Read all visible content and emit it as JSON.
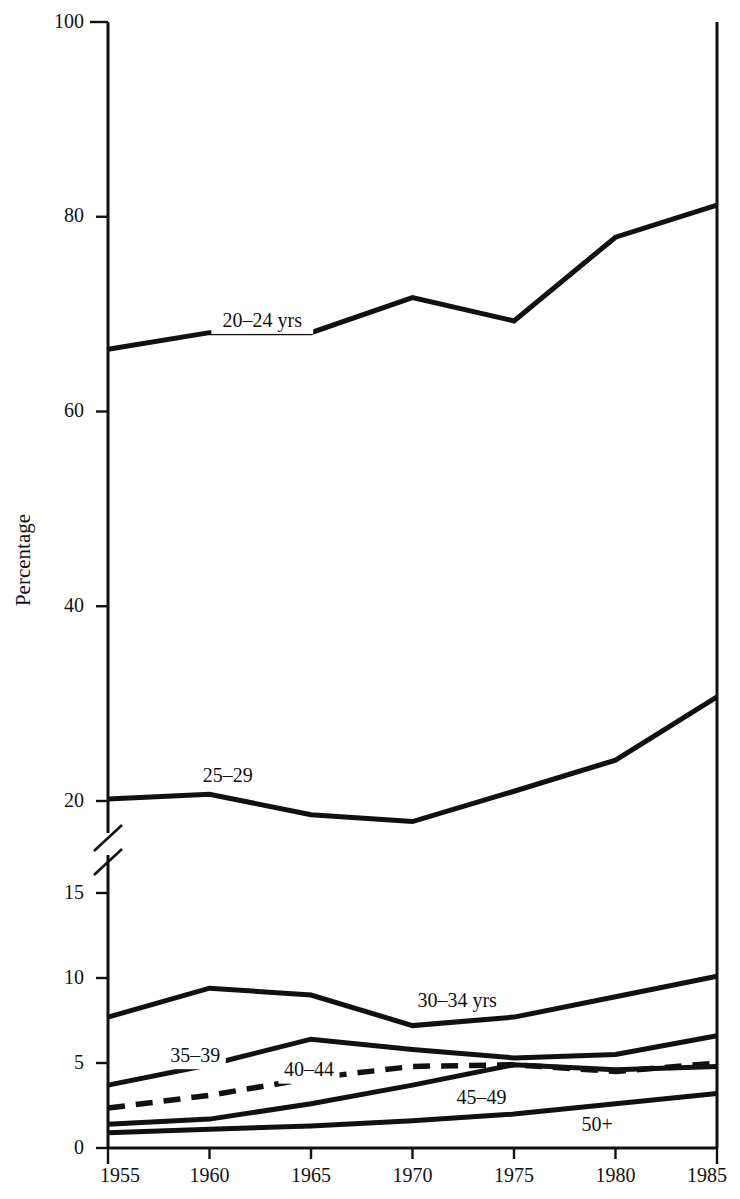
{
  "chart_data": {
    "type": "line",
    "title": "",
    "subtitle": "",
    "xlabel": "",
    "ylabel": "Percentage",
    "x": [
      1955,
      1960,
      1965,
      1970,
      1975,
      1980,
      1985
    ],
    "xtick_labels": [
      "1955",
      "1960",
      "1965",
      "1970",
      "1975",
      "1980",
      "1985"
    ],
    "ytick_labels_upper": [
      "100",
      "80",
      "60",
      "40",
      "20"
    ],
    "ytick_values_upper": [
      100,
      80,
      60,
      40,
      20
    ],
    "ytick_labels_lower": [
      "15",
      "10",
      "5",
      "0"
    ],
    "ytick_values_lower": [
      15,
      10,
      5,
      0
    ],
    "ylim_upper": [
      20,
      100
    ],
    "ylim_lower": [
      0,
      15
    ],
    "axis_break": true,
    "axis_break_between": [
      15,
      20
    ],
    "grid": false,
    "legend_position": "inline-on-lines",
    "series": [
      {
        "name": "20-24 yrs",
        "label": "20–24 yrs",
        "style": "solid",
        "values": [
          66.4,
          68.1,
          68.1,
          71.7,
          69.3,
          77.9,
          81.2
        ]
      },
      {
        "name": "25-29",
        "label": "25–29",
        "style": "solid",
        "values": [
          20.2,
          20.7,
          19.6,
          19.2,
          21.0,
          24.2,
          30.7
        ]
      },
      {
        "name": "30-34 yrs",
        "label": "30–34 yrs",
        "style": "solid",
        "values": [
          7.7,
          9.4,
          9.0,
          7.2,
          7.7,
          8.9,
          10.1
        ]
      },
      {
        "name": "35-39",
        "label": "35–39",
        "style": "solid",
        "values": [
          3.7,
          4.9,
          6.4,
          5.8,
          5.3,
          5.5,
          6.6
        ]
      },
      {
        "name": "40-44",
        "label": "40–44",
        "style": "dashed",
        "values": [
          2.35,
          3.1,
          4.1,
          4.8,
          4.9,
          4.5,
          5.0
        ]
      },
      {
        "name": "45-49",
        "label": "45–49",
        "style": "solid",
        "values": [
          1.4,
          1.7,
          2.6,
          3.7,
          4.9,
          4.6,
          4.8
        ]
      },
      {
        "name": "50+",
        "label": "50+",
        "style": "solid",
        "values": [
          0.9,
          1.1,
          1.3,
          1.6,
          2.0,
          2.6,
          3.2
        ]
      }
    ],
    "series_label_positions": [
      {
        "name": "20-24 yrs",
        "x": 1962.6,
        "y": 69.3
      },
      {
        "name": "25-29",
        "x": 1960.9,
        "y": 22.5
      },
      {
        "name": "30-34 yrs",
        "x": 1972.2,
        "y": 8.6
      },
      {
        "name": "35-39",
        "x": 1959.3,
        "y": 5.4
      },
      {
        "name": "40-44",
        "x": 1964.9,
        "y": 4.55
      },
      {
        "name": "45-49",
        "x": 1973.4,
        "y": 2.9
      },
      {
        "name": "50+",
        "x": 1979.1,
        "y": 1.35
      }
    ],
    "colors": {
      "line": "#111111",
      "axis": "#111111",
      "text": "#111111",
      "background": "#ffffff"
    }
  }
}
